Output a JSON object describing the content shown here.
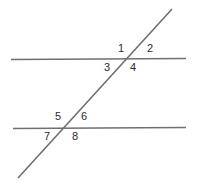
{
  "figure": {
    "width": 197,
    "height": 187,
    "background_color": "#ffffff",
    "line_color": "#6f6f6f",
    "label_color": "#2b2b2b",
    "line_width": 1.6
  },
  "lines": {
    "top_parallel": {
      "name": "top-parallel-line",
      "x1": 11,
      "y1": 59.5,
      "x2": 186,
      "y2": 58.5
    },
    "bottom_parallel": {
      "name": "bottom-parallel-line",
      "x1": 13,
      "y1": 128.5,
      "x2": 186,
      "y2": 127.5
    },
    "transversal": {
      "name": "transversal-line",
      "x1": 18,
      "y1": 178,
      "x2": 172,
      "y2": 9
    }
  },
  "intersections": {
    "upper": {
      "x": 125,
      "y": 59
    },
    "lower": {
      "x": 67,
      "y": 128
    }
  },
  "angle_labels": [
    {
      "id": "1",
      "text": "1",
      "x": 118,
      "y": 43,
      "position": "upper-intersection-above-left"
    },
    {
      "id": "2",
      "text": "2",
      "x": 147,
      "y": 43,
      "position": "upper-intersection-above-right"
    },
    {
      "id": "3",
      "text": "3",
      "x": 104,
      "y": 62,
      "position": "upper-intersection-below-left"
    },
    {
      "id": "4",
      "text": "4",
      "x": 130,
      "y": 62,
      "position": "upper-intersection-below-right"
    },
    {
      "id": "5",
      "text": "5",
      "x": 55,
      "y": 111,
      "position": "lower-intersection-above-left"
    },
    {
      "id": "6",
      "text": "6",
      "x": 81,
      "y": 111,
      "position": "lower-intersection-above-right"
    },
    {
      "id": "7",
      "text": "7",
      "x": 44,
      "y": 131,
      "position": "lower-intersection-below-left"
    },
    {
      "id": "8",
      "text": "8",
      "x": 72,
      "y": 131,
      "position": "lower-intersection-below-right"
    }
  ]
}
